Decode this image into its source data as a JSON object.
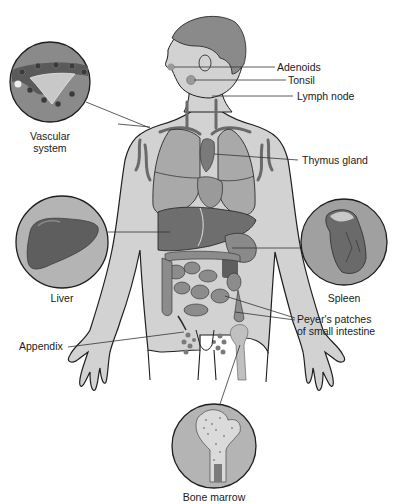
{
  "diagram": {
    "colors": {
      "skin": "#d2d2d2",
      "hair": "#8a8a8a",
      "organ_light": "#a9a9a9",
      "organ_mid": "#8c8c8c",
      "organ_dark": "#5e5e5e",
      "inset_bg": "#b4b4b4",
      "outline": "#1e1e1e",
      "leader": "#333333",
      "text": "#1a1a1a"
    },
    "labels": {
      "adenoids": "Adenoids",
      "tonsil": "Tonsil",
      "lymph_node": "Lymph node",
      "vascular_system_line1": "Vascular",
      "vascular_system_line2": "system",
      "thymus_gland": "Thymus gland",
      "liver": "Liver",
      "spleen": "Spleen",
      "appendix": "Appendix",
      "peyers_line1": "Peyer's patches",
      "peyers_line2": "of small intestine",
      "bone_marrow": "Bone marrow"
    },
    "insets": [
      {
        "name": "vascular-system",
        "cx": 50,
        "cy": 82,
        "r": 40
      },
      {
        "name": "liver",
        "cx": 62,
        "cy": 242,
        "r": 46
      },
      {
        "name": "spleen",
        "cx": 344,
        "cy": 242,
        "r": 43
      },
      {
        "name": "bone-marrow",
        "cx": 214,
        "cy": 446,
        "r": 42
      }
    ]
  }
}
